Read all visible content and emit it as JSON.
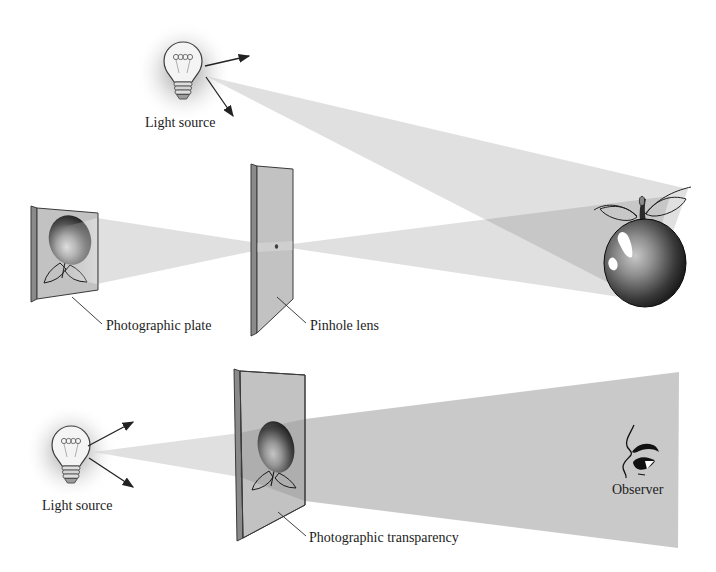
{
  "figure": {
    "background": "#ffffff",
    "top_diagram": {
      "light_source_label": "Light source",
      "photographic_plate_label": "Photographic plate",
      "pinhole_lens_label": "Pinhole lens"
    },
    "bottom_diagram": {
      "light_source_label": "Light source",
      "photographic_transparency_label": "Photographic transparency",
      "observer_label": "Observer"
    },
    "colors": {
      "beam_tint": "#666666",
      "beam_solid": "#c9c9c9",
      "plate_front": "#c2c2c2",
      "plate_side": "#8a8a8a",
      "outline": "#3a3a3a",
      "text": "#1c1c1c",
      "highlight": "#ffffff"
    }
  }
}
